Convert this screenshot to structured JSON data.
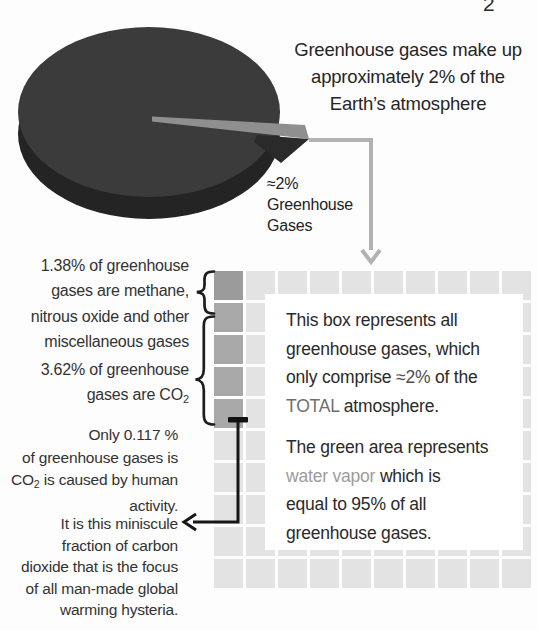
{
  "page": {
    "number": "2",
    "background": "#fdfdfd"
  },
  "headline": {
    "line1": "Greenhouse gases make up",
    "line2": "approximately 2% of the",
    "line3": "Earth’s atmosphere"
  },
  "pie": {
    "title": "Total Atmosphere",
    "subtitle_line1": "(Oxygen, Nitrogen",
    "subtitle_line2": "and Other Gases)",
    "slice_label_line1": "≈2%",
    "slice_label_line2": "Greenhouse",
    "slice_label_line3": "Gases",
    "colors": {
      "pie_top": "#3b3b3b",
      "pie_side": "#242424",
      "slice_top": "#8f8f8f",
      "slice_front": "#2a2a2a",
      "label_text": "#f2f2f2"
    }
  },
  "grid": {
    "rows": 10,
    "cols": 10,
    "cell_light": "#e3e3e3",
    "col1_row1_dark": "#9b9b9b",
    "col1_rows2to5_dark": "#a8a8a8",
    "tick_color": "#111111"
  },
  "annotations": {
    "methane": {
      "line1": "1.38% of greenhouse",
      "line2": "gases are methane,",
      "line3": "nitrous oxide and other",
      "line4": "miscellaneous gases"
    },
    "co2": {
      "line1": "3.62% of greenhouse",
      "line2_pre": "gases are CO",
      "line2_sub": "2"
    },
    "human": {
      "line1": "Only 0.117 %",
      "line2": "of greenhouse gases is",
      "line3_pre": "CO",
      "line3_sub": "2",
      "line3_post": " is caused by human",
      "line4": "activity."
    },
    "hysteria": {
      "line1": "It is this miniscule",
      "line2": "fraction of carbon",
      "line3": "dioxide that is the focus",
      "line4": "of all man-made global",
      "line5": "warming hysteria."
    }
  },
  "infobox": {
    "p1_line1": "This box represents all",
    "p1_line2": "greenhouse gases, which",
    "p1_line3_pre": "only comprise ",
    "p1_line3_hl": "≈2%",
    "p1_line3_post": " of the",
    "p1_line4_hl": "TOTAL",
    "p1_line4_post": " atmosphere.",
    "p2_line1": "The green area represents",
    "p2_line2_hl": "water vapor",
    "p2_line2_post": " which is",
    "p2_line3": "equal to 95% of all",
    "p2_line4": "greenhouse gases.",
    "highlight_colors": {
      "pct": "#4f4f4f",
      "total": "#6f6f6f",
      "water_vapor": "#9c9c9c"
    }
  },
  "arrows": {
    "gray_elbow_color": "#b2b2b2",
    "black_arrow_color": "#161616",
    "brace_color": "#1d1d1d"
  },
  "chart_data": [
    {
      "type": "pie",
      "title": "Total Atmosphere",
      "slices": [
        {
          "label": "Total Atmosphere (Oxygen, Nitrogen and Other Gases)",
          "value": 98
        },
        {
          "label": "Greenhouse Gases",
          "value": 2
        }
      ],
      "annotations": [
        "≈2% Greenhouse Gases",
        "Greenhouse gases make up approximately 2% of the Earth’s atmosphere"
      ],
      "style": "3d exploded pie, grayscale scan"
    },
    {
      "type": "heatmap",
      "note": "10x10 waffle grid, 100 cells = all greenhouse gases (≈2% of total atmosphere)",
      "slices": [
        {
          "label": "water vapor (green area)",
          "value": 95
        },
        {
          "label": "CO2",
          "value": 3.62
        },
        {
          "label": "methane, nitrous oxide and other miscellaneous gases",
          "value": 1.38
        },
        {
          "label": "CO2 caused by human activity",
          "value": 0.117
        }
      ],
      "unit": "% of greenhouse gases"
    }
  ]
}
